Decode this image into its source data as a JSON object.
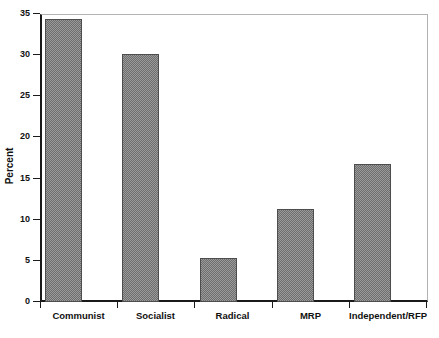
{
  "chart_data": {
    "type": "bar",
    "title": "",
    "subtitle": "",
    "xlabel": "",
    "ylabel": "Percent",
    "categories": [
      "Communist",
      "Socialist",
      "Radical",
      "MRP",
      "Independent/RFP"
    ],
    "values": [
      34.4,
      30.1,
      5.3,
      11.3,
      16.8
    ],
    "series": [
      {
        "name": "Percent",
        "values": [
          34.4,
          30.1,
          5.3,
          11.3,
          16.8
        ]
      }
    ],
    "ylim": [
      0,
      35
    ],
    "y_ticks": [
      0,
      5,
      10,
      15,
      20,
      25,
      30,
      35
    ],
    "y_tick_labels": [
      "0",
      "5",
      "10",
      "15",
      "20",
      "25",
      "30",
      "35"
    ],
    "grid": false,
    "legend": null,
    "legend_position": "none",
    "bar_fill_color": "#9a9a9a",
    "bar_pattern": "dither-checker",
    "bar_edge_color": "#4d4d4d",
    "axis_color": "#1a1a1a",
    "frame_color": "#b3b3b3",
    "background_color": "#ffffff",
    "annotations": []
  }
}
